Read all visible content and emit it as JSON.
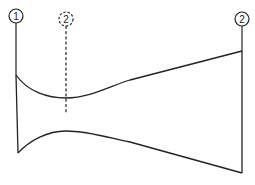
{
  "diagram": {
    "type": "nozzle-cross-section",
    "stroke_color": "#222222",
    "background": "#ffffff",
    "stations": [
      {
        "label": "1",
        "style": "solid",
        "x": 16,
        "circle_y": 16
      },
      {
        "label": "2",
        "style": "dashed",
        "x": 66,
        "circle_y": 19
      },
      {
        "label": "2",
        "style": "solid",
        "x": 242,
        "circle_y": 19
      }
    ],
    "shape": {
      "description": "Converging-diverging duct: inlet at station 1, throat near dashed station 2, exit at station 2",
      "inlet_top": [
        16,
        75
      ],
      "inlet_bottom": [
        18,
        153
      ],
      "throat_top": [
        66,
        98
      ],
      "throat_bottom": [
        66,
        131
      ],
      "exit_top": [
        242,
        51
      ],
      "exit_bottom": [
        242,
        173
      ]
    }
  }
}
